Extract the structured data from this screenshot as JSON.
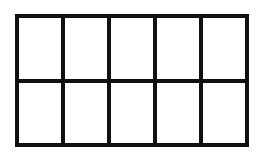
{
  "diagram": {
    "type": "grid",
    "rows": 2,
    "columns": 5,
    "total_cells": 10,
    "shaded_cells": 0,
    "line_color": "#111111",
    "fill_color": "#ffffff"
  }
}
